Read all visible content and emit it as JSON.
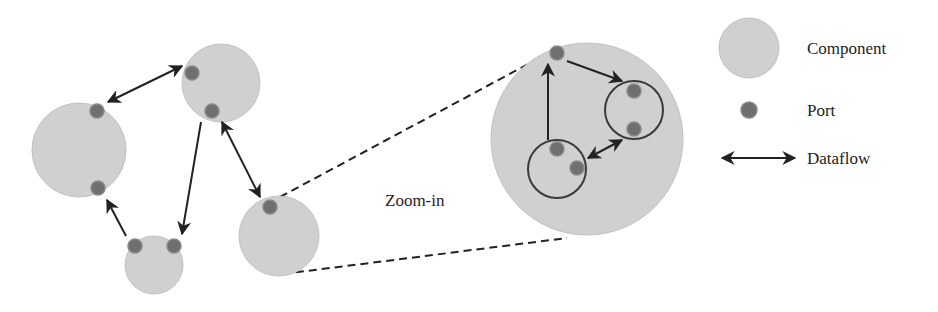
{
  "diagram": {
    "zoom_label": "Zoom-in",
    "legend": {
      "component": "Component",
      "port": "Port",
      "dataflow": "Dataflow"
    },
    "colors": {
      "component_fill": "#d0d0d0",
      "port_fill": "#6f6f6f",
      "arrow": "#222222"
    },
    "components": [
      {
        "id": "left",
        "cx": 79,
        "cy": 150,
        "r": 47,
        "ports": 2
      },
      {
        "id": "top",
        "cx": 221,
        "cy": 83,
        "r": 39,
        "ports": 2
      },
      {
        "id": "bottom",
        "cx": 154,
        "cy": 265,
        "r": 29,
        "ports": 2
      },
      {
        "id": "right",
        "cx": 279,
        "cy": 236,
        "r": 40,
        "ports": 1
      },
      {
        "id": "zoomed",
        "cx": 587,
        "cy": 139,
        "r": 96,
        "ports": 1,
        "sub_components": 2
      }
    ]
  }
}
